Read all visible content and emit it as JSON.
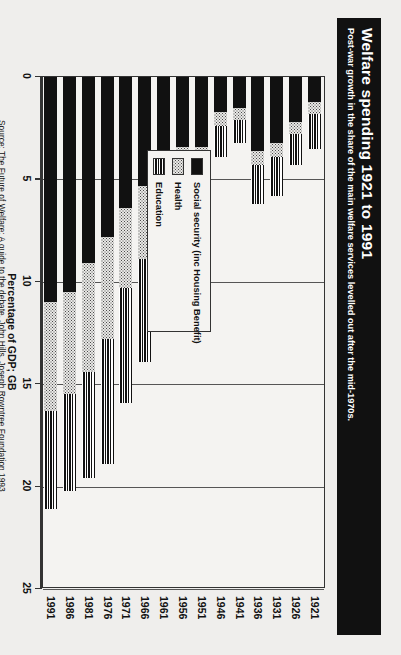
{
  "header": {
    "title": "Welfare spending 1921 to 1991",
    "subtitle": "Post-war growth in the share of the main welfare services levelled out after the mid-1970s."
  },
  "source": {
    "label": "Source: The Future of Welfare: A guide to the debate, John Hills, Joseph Rowntree Foundation 1993"
  },
  "legend": {
    "items": [
      {
        "label": "Social security (inc Housing Benefit)",
        "key": "social",
        "color": "#111111",
        "pattern": "solid-black"
      },
      {
        "label": "Health",
        "key": "health",
        "color": "#9a9a9a",
        "pattern": "dotted-grey"
      },
      {
        "label": "Education",
        "key": "education",
        "color": "#111111",
        "pattern": "horizontal-stripes"
      }
    ]
  },
  "chart_data": {
    "type": "bar",
    "orientation": "horizontal-stacked",
    "title": "Welfare spending 1921 to 1991",
    "subtitle": "Post-war growth in the share of the main welfare services levelled out after the mid-1970s.",
    "xlabel": "Percentage of GDP; GB",
    "ylabel": "",
    "xlim": [
      0,
      25
    ],
    "xticks": [
      0,
      5,
      10,
      15,
      20,
      25
    ],
    "xticklabels": [
      "0",
      "5",
      "10",
      "15",
      "20",
      "25"
    ],
    "grid": true,
    "legend_position": "upper-left-inset",
    "categories": [
      "1921",
      "1926",
      "1931",
      "1936",
      "1941",
      "1946",
      "1951",
      "1956",
      "1961",
      "1966",
      "1971",
      "1976",
      "1981",
      "1986",
      "1991"
    ],
    "series": [
      {
        "name": "Social security (inc Housing Benefit)",
        "values": [
          1.2,
          2.2,
          3.2,
          3.6,
          1.5,
          1.7,
          3.4,
          3.4,
          4.3,
          5.3,
          6.4,
          7.8,
          9.1,
          10.5,
          11.0
        ]
      },
      {
        "name": "Health",
        "values": [
          0.6,
          0.6,
          0.7,
          0.7,
          0.6,
          0.7,
          3.2,
          3.1,
          3.2,
          3.6,
          3.9,
          5.0,
          5.3,
          5.0,
          5.3
        ]
      },
      {
        "name": "Education",
        "values": [
          1.7,
          1.5,
          1.9,
          1.9,
          1.1,
          1.5,
          2.8,
          3.0,
          3.9,
          5.0,
          5.6,
          6.1,
          5.2,
          4.7,
          4.8
        ]
      }
    ],
    "totals": [
      3.5,
      4.3,
      5.8,
      6.2,
      3.2,
      3.9,
      9.4,
      9.5,
      11.4,
      13.9,
      15.9,
      18.9,
      19.6,
      20.2,
      21.1
    ]
  }
}
